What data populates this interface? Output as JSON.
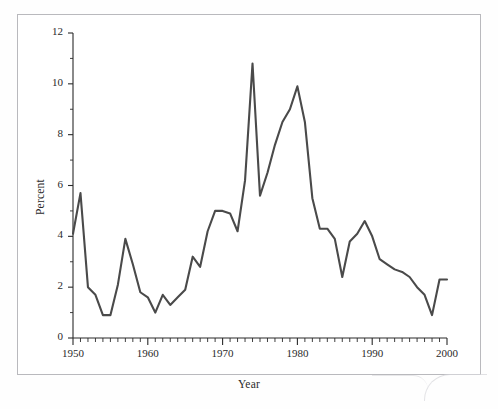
{
  "figure": {
    "background_color": "#ffffff",
    "frame_color": "#b9b9bd",
    "line_color": "#4a4a4a",
    "axis_color": "#2a2a2a"
  },
  "axes": {
    "x": {
      "label": "Year",
      "min": 1950,
      "max": 2000,
      "major_ticks": [
        1950,
        1960,
        1970,
        1980,
        1990,
        2000
      ],
      "major_tick_labels": [
        "1950",
        "1960",
        "1970",
        "1980",
        "1990",
        "2000"
      ],
      "minor_tick_step": 1
    },
    "y": {
      "label": "Percent",
      "min": 0,
      "max": 12,
      "major_ticks": [
        0,
        2,
        4,
        6,
        8,
        10,
        12
      ],
      "major_tick_labels": [
        "0",
        "2",
        "4",
        "6",
        "8",
        "10",
        "12"
      ],
      "minor_tick_step": 1
    }
  },
  "chart_data": {
    "type": "line",
    "title": "",
    "xlabel": "Year",
    "ylabel": "Percent",
    "xlim": [
      1950,
      2000
    ],
    "ylim": [
      0,
      12
    ],
    "grid": false,
    "legend": null,
    "series": [
      {
        "name": "Percent",
        "color": "#4a4a4a",
        "x": [
          1950,
          1951,
          1952,
          1953,
          1954,
          1955,
          1956,
          1957,
          1958,
          1959,
          1960,
          1961,
          1962,
          1963,
          1964,
          1965,
          1966,
          1967,
          1968,
          1969,
          1970,
          1971,
          1972,
          1973,
          1974,
          1975,
          1976,
          1977,
          1978,
          1979,
          1980,
          1981,
          1982,
          1983,
          1984,
          1985,
          1986,
          1987,
          1988,
          1989,
          1990,
          1991,
          1992,
          1993,
          1994,
          1995,
          1996,
          1997,
          1998,
          1999,
          2000
        ],
        "values": [
          4.1,
          5.7,
          2.0,
          1.7,
          0.9,
          0.9,
          2.1,
          3.9,
          2.9,
          1.8,
          1.6,
          1.0,
          1.7,
          1.3,
          1.6,
          1.9,
          3.2,
          2.8,
          4.2,
          5.0,
          5.0,
          4.9,
          4.2,
          6.2,
          10.8,
          5.6,
          6.5,
          7.6,
          8.5,
          9.0,
          9.9,
          8.5,
          5.5,
          4.3,
          4.3,
          3.9,
          2.4,
          3.8,
          4.1,
          4.6,
          4.0,
          3.1,
          2.9,
          2.7,
          2.6,
          2.4,
          2.0,
          1.7,
          0.9,
          2.3,
          2.3
        ]
      }
    ]
  }
}
